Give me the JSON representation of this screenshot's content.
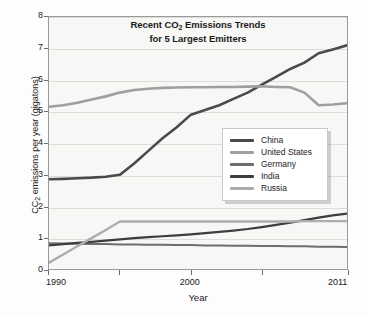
{
  "chart_data": {
    "type": "line",
    "title": "Recent CO2 Emissions Trends for 5 Largest Emitters",
    "title_line1_pre": "Recent CO",
    "title_line1_sub": "2",
    "title_line1_post": " Emissions Trends",
    "title_line2": "for 5 Largest Emitters",
    "xlabel": "Year",
    "ylabel_pre": "CC",
    "ylabel_sub": "2",
    "ylabel_post": " emissions per year (gigatons)",
    "ylabel": "CC2 emissions per year (gigatons)",
    "xlim": [
      1990,
      2011
    ],
    "ylim": [
      0,
      8
    ],
    "yticks": [
      "8",
      "7",
      "6",
      "5",
      "4",
      "3",
      "2",
      "1",
      "0"
    ],
    "ytick_values": [
      8,
      7,
      6,
      5,
      4,
      3,
      2,
      1,
      0
    ],
    "xticks": [
      "1990",
      "2000",
      "2011"
    ],
    "xtick_values": [
      1990,
      2000,
      2011
    ],
    "xtick_minor_values": [
      1995,
      2005
    ],
    "grid": "horizontal",
    "legend_position": "center-right",
    "x": [
      1990,
      1991,
      1992,
      1993,
      1994,
      1995,
      1996,
      1997,
      1998,
      1999,
      2000,
      2001,
      2002,
      2003,
      2004,
      2005,
      2006,
      2007,
      2008,
      2009,
      2010,
      2011
    ],
    "series": [
      {
        "name": "China",
        "color": "#4a4a4a",
        "values": [
          2.85,
          2.86,
          2.88,
          2.9,
          2.93,
          2.99,
          3.35,
          3.75,
          4.15,
          4.5,
          4.9,
          5.05,
          5.2,
          5.4,
          5.6,
          5.85,
          6.1,
          6.35,
          6.55,
          6.85,
          6.97,
          7.1
        ]
      },
      {
        "name": "United States",
        "color": "#9f9f9f",
        "values": [
          5.15,
          5.2,
          5.28,
          5.38,
          5.48,
          5.6,
          5.68,
          5.72,
          5.75,
          5.76,
          5.77,
          5.77,
          5.78,
          5.78,
          5.79,
          5.8,
          5.78,
          5.77,
          5.6,
          5.2,
          5.22,
          5.26
        ]
      },
      {
        "name": "Germany",
        "color": "#6e6e6e",
        "values": [
          0.82,
          0.81,
          0.8,
          0.79,
          0.79,
          0.78,
          0.78,
          0.77,
          0.77,
          0.76,
          0.76,
          0.75,
          0.75,
          0.74,
          0.74,
          0.73,
          0.73,
          0.72,
          0.72,
          0.71,
          0.71,
          0.7
        ]
      },
      {
        "name": "India",
        "color": "#3d3d3d",
        "values": [
          0.75,
          0.79,
          0.83,
          0.86,
          0.9,
          0.94,
          0.98,
          1.01,
          1.04,
          1.07,
          1.1,
          1.14,
          1.18,
          1.22,
          1.27,
          1.33,
          1.4,
          1.47,
          1.55,
          1.63,
          1.7,
          1.76
        ]
      },
      {
        "name": "Russia",
        "color": "#adadad",
        "values": [
          0.2,
          0.46,
          0.72,
          0.98,
          1.24,
          1.51,
          1.51,
          1.51,
          1.51,
          1.51,
          1.51,
          1.51,
          1.51,
          1.51,
          1.51,
          1.51,
          1.51,
          1.51,
          1.52,
          1.52,
          1.52,
          1.52
        ]
      }
    ]
  },
  "legend": {
    "items": [
      {
        "label": "China"
      },
      {
        "label": "United States"
      },
      {
        "label": "Germany"
      },
      {
        "label": "India"
      },
      {
        "label": "Russia"
      }
    ]
  }
}
